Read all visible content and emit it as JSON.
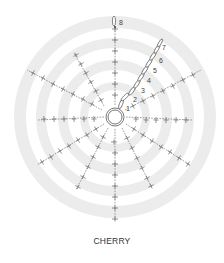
{
  "title": "CHERRY",
  "diagram": {
    "type": "crochet-chart",
    "center": [
      115,
      117
    ],
    "bands": [
      {
        "r": 31,
        "w": 8
      },
      {
        "r": 52,
        "w": 10
      },
      {
        "r": 74,
        "w": 10
      },
      {
        "r": 95,
        "w": 12
      }
    ],
    "center_ring": {
      "r_outer": 9,
      "r_inner": 7
    },
    "spokes": [
      {
        "from": [
          115,
          105
        ],
        "to": [
          115,
          27
        ],
        "ticks": [
          [
            115,
            95
          ],
          [
            115,
            84
          ],
          [
            115,
            73
          ],
          [
            115,
            62
          ],
          [
            115,
            51
          ],
          [
            115,
            40
          ],
          [
            115,
            29
          ]
        ]
      },
      {
        "from": [
          104,
          106
        ],
        "to": [
          74,
          53
        ],
        "ticks": [
          [
            101,
            100
          ],
          [
            96,
            91
          ],
          [
            91,
            82
          ],
          [
            86,
            73
          ],
          [
            81,
            64
          ],
          [
            76,
            55
          ]
        ]
      },
      {
        "from": [
          102,
          110
        ],
        "to": [
          27,
          70
        ],
        "ticks": [
          [
            92,
            104
          ],
          [
            83,
            99
          ],
          [
            73,
            94
          ],
          [
            63,
            89
          ],
          [
            53,
            84
          ],
          [
            43,
            78
          ],
          [
            33,
            73
          ]
        ]
      },
      {
        "from": [
          104,
          117
        ],
        "to": [
          38,
          120
        ],
        "ticks": [
          [
            94,
            119
          ],
          [
            84,
            119
          ],
          [
            74,
            119
          ],
          [
            64,
            119
          ],
          [
            54,
            119
          ],
          [
            44,
            119
          ]
        ]
      },
      {
        "from": [
          104,
          124
        ],
        "to": [
          37,
          165
        ],
        "ticks": [
          [
            96,
            129
          ],
          [
            87,
            135
          ],
          [
            78,
            140
          ],
          [
            69,
            146
          ],
          [
            60,
            151
          ],
          [
            51,
            157
          ],
          [
            42,
            162
          ]
        ]
      },
      {
        "from": [
          108,
          128
        ],
        "to": [
          76,
          190
        ],
        "ticks": [
          [
            103,
            137
          ],
          [
            98,
            147
          ],
          [
            93,
            157
          ],
          [
            88,
            167
          ],
          [
            83,
            177
          ],
          [
            78,
            187
          ]
        ]
      },
      {
        "from": [
          115,
          129
        ],
        "to": [
          115,
          220
        ],
        "ticks": [
          [
            114,
            142
          ],
          [
            115,
            153
          ],
          [
            115,
            164
          ],
          [
            115,
            175
          ],
          [
            115,
            186
          ],
          [
            115,
            197
          ],
          [
            115,
            208
          ],
          [
            115,
            219
          ]
        ]
      },
      {
        "from": [
          122,
          128
        ],
        "to": [
          152,
          188
        ],
        "ticks": [
          [
            127,
            138
          ],
          [
            132,
            148
          ],
          [
            137,
            158
          ],
          [
            142,
            168
          ],
          [
            147,
            178
          ],
          [
            151,
            186
          ]
        ]
      },
      {
        "from": [
          126,
          124
        ],
        "to": [
          190,
          165
        ],
        "ticks": [
          [
            134,
            129
          ],
          [
            143,
            135
          ],
          [
            152,
            141
          ],
          [
            161,
            147
          ],
          [
            170,
            152
          ],
          [
            179,
            158
          ],
          [
            188,
            164
          ]
        ]
      },
      {
        "from": [
          126,
          117
        ],
        "to": [
          192,
          120
        ],
        "ticks": [
          [
            136,
            119
          ],
          [
            146,
            120
          ],
          [
            156,
            120
          ],
          [
            166,
            120
          ],
          [
            176,
            120
          ],
          [
            186,
            120
          ]
        ]
      },
      {
        "from": [
          125,
          110
        ],
        "to": [
          201,
          70
        ],
        "ticks": [
          [
            133,
            106
          ],
          [
            143,
            101
          ],
          [
            153,
            96
          ],
          [
            163,
            91
          ],
          [
            173,
            86
          ],
          [
            183,
            80
          ],
          [
            193,
            75
          ]
        ]
      }
    ],
    "chains": [
      {
        "cx": 121,
        "cy": 104,
        "rx": 1.6,
        "ry": 5,
        "rot": 20
      },
      {
        "cx": 125,
        "cy": 97,
        "rx": 1.6,
        "ry": 5,
        "rot": 45
      },
      {
        "cx": 132,
        "cy": 91,
        "rx": 1.6,
        "ry": 5,
        "rot": 35
      },
      {
        "cx": 137,
        "cy": 84,
        "rx": 1.6,
        "ry": 5,
        "rot": 33
      },
      {
        "cx": 141,
        "cy": 77,
        "rx": 1.6,
        "ry": 5,
        "rot": 33
      },
      {
        "cx": 145,
        "cy": 70,
        "rx": 1.6,
        "ry": 5,
        "rot": 33
      },
      {
        "cx": 149,
        "cy": 63,
        "rx": 1.6,
        "ry": 5,
        "rot": 33
      },
      {
        "cx": 153,
        "cy": 56,
        "rx": 1.6,
        "ry": 5,
        "rot": 33
      },
      {
        "cx": 157,
        "cy": 49,
        "rx": 1.6,
        "ry": 5,
        "rot": 30
      },
      {
        "cx": 160,
        "cy": 43,
        "rx": 1.4,
        "ry": 4.5,
        "rot": 30
      },
      {
        "cx": 114,
        "cy": 21,
        "rx": 1.6,
        "ry": 5,
        "rot": 0
      }
    ],
    "round_labels": [
      {
        "text": "1",
        "x": 126,
        "y": 111
      },
      {
        "text": "2",
        "x": 133,
        "y": 102
      },
      {
        "text": "3",
        "x": 141,
        "y": 93
      },
      {
        "text": "4",
        "x": 147,
        "y": 83
      },
      {
        "text": "5",
        "x": 153,
        "y": 73
      },
      {
        "text": "6",
        "x": 159,
        "y": 63
      },
      {
        "text": "7",
        "x": 162,
        "y": 50
      },
      {
        "text": "8",
        "x": 119,
        "y": 25
      }
    ]
  }
}
